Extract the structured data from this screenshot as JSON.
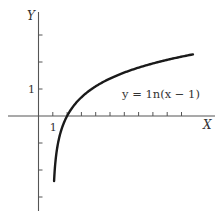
{
  "chart_data": {
    "type": "line",
    "title": "",
    "xlabel": "X",
    "ylabel": "Y",
    "xlim": [
      -2.7,
      12.8
    ],
    "ylim": [
      -3.5,
      4.0
    ],
    "x_ticks": [
      1,
      2,
      3,
      4,
      5,
      6,
      7,
      8,
      9,
      10
    ],
    "x_tick_labels": [
      {
        "value": 1,
        "label": "1"
      }
    ],
    "y_ticks": [
      3,
      2,
      1,
      -1,
      -2,
      -3
    ],
    "y_tick_labels": [
      {
        "value": 1,
        "label": "1"
      }
    ],
    "grid": false,
    "series": [
      {
        "name": "y = ln(x − 1)",
        "function": "ln(x-1)",
        "x_range": [
          1.09,
          10.8
        ],
        "color": "#1a1a1a"
      }
    ],
    "annotations": [
      {
        "text": "y = 1n(x − 1)",
        "x": 6.8,
        "y": 0.65
      }
    ]
  }
}
